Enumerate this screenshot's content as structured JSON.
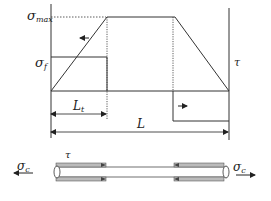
{
  "diagram": {
    "type": "shear-lag stress distribution along fiber",
    "labels": {
      "sigma_max": {
        "symbol": "σ",
        "sub": "max"
      },
      "sigma_f": {
        "symbol": "σ",
        "sub": "f"
      },
      "tau_right": "τ",
      "L_t": {
        "symbol": "L",
        "sub": "t"
      },
      "L": "L",
      "tau_fiber": "τ",
      "sigma_c_left": {
        "symbol": "σ",
        "sub": "c"
      },
      "sigma_c_right": {
        "symbol": "σ",
        "sub": "c"
      }
    },
    "curves": {
      "fiber_stress": "trapezoid: rises linearly over L_t to σ_max, plateau, falls linearly to zero at end",
      "shear_stress": "step: τ constant over transfer length, zero in middle, reversed at right end"
    },
    "colors": {
      "line": "#333333",
      "fiber_fill": "#d8d8d8"
    }
  }
}
